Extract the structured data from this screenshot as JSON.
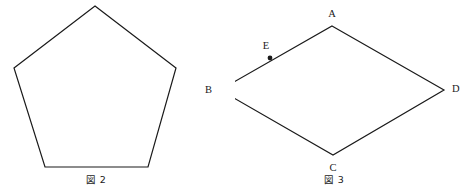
{
  "canvas": {
    "width": 471,
    "height": 194,
    "background": "#ffffff",
    "stroke_color": "#1a1a1a",
    "stroke_width": 1.2,
    "text_color": "#1a1a1a"
  },
  "figures": [
    {
      "id": "figure-2",
      "caption": "図 2",
      "caption_position": {
        "x": 96,
        "y": 180
      },
      "shape": "regular-pentagon",
      "vertices": [
        {
          "name": "apex",
          "x": 95,
          "y": 6
        },
        {
          "name": "upper-right",
          "x": 176,
          "y": 68
        },
        {
          "name": "lower-right",
          "x": 148,
          "y": 167
        },
        {
          "name": "lower-left",
          "x": 45,
          "y": 167
        },
        {
          "name": "upper-left",
          "x": 14,
          "y": 68
        }
      ],
      "points": [],
      "labels": []
    },
    {
      "id": "figure-3",
      "caption": "図 3",
      "caption_position": {
        "x": 334,
        "y": 180
      },
      "shape": "rhombus",
      "vertices": [
        {
          "name": "A",
          "x": 332,
          "y": 26
        },
        {
          "name": "D",
          "x": 444,
          "y": 90
        },
        {
          "name": "C",
          "x": 333,
          "y": 155
        },
        {
          "name": "B",
          "x": 220,
          "y": 90
        }
      ],
      "points": [
        {
          "name": "E",
          "x": 270,
          "y": 58,
          "on_segment": "AB",
          "marker": "filled-dot",
          "radius": 2.4
        }
      ],
      "labels": [
        {
          "text": "A",
          "x": 332,
          "y": 14,
          "anchor": "center"
        },
        {
          "text": "B",
          "x": 212,
          "y": 90,
          "anchor": "right"
        },
        {
          "text": "C",
          "x": 333,
          "y": 168,
          "anchor": "center"
        },
        {
          "text": "D",
          "x": 452,
          "y": 89,
          "anchor": "left"
        },
        {
          "text": "E",
          "x": 266,
          "y": 46,
          "anchor": "center"
        }
      ]
    }
  ]
}
